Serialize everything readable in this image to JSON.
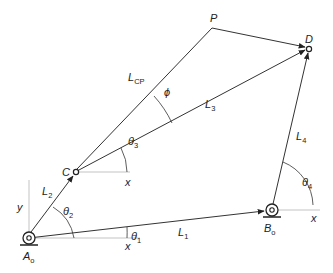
{
  "diagram": {
    "type": "four-bar linkage coupler point diagram",
    "points": {
      "A0": {
        "label": "A",
        "sub": "o",
        "x": 29,
        "y": 238
      },
      "B0": {
        "label": "B",
        "sub": "o",
        "x": 272,
        "y": 210
      },
      "C": {
        "label": "C",
        "x": 75,
        "y": 172
      },
      "D": {
        "label": "D",
        "x": 309,
        "y": 48
      },
      "P": {
        "label": "P",
        "x": 212,
        "y": 28
      }
    },
    "links": [
      {
        "name": "L1",
        "label": "L",
        "sub": "1",
        "from": "A0",
        "to": "B0"
      },
      {
        "name": "L2",
        "label": "L",
        "sub": "2",
        "from": "A0",
        "to": "C"
      },
      {
        "name": "L3",
        "label": "L",
        "sub": "3",
        "from": "C",
        "to": "D"
      },
      {
        "name": "L4",
        "label": "L",
        "sub": "4",
        "from": "B0",
        "to": "D"
      },
      {
        "name": "LCP",
        "label": "L",
        "sub": "CP",
        "from": "C",
        "to": "P"
      },
      {
        "name": "PD",
        "label": "",
        "from": "P",
        "to": "D"
      }
    ],
    "angles": {
      "theta1": {
        "label": "θ",
        "sub": "1"
      },
      "theta2": {
        "label": "θ",
        "sub": "2"
      },
      "theta3": {
        "label": "θ",
        "sub": "3"
      },
      "theta4": {
        "label": "θ",
        "sub": "4"
      },
      "phi": {
        "label": "ϕ"
      }
    },
    "axes": {
      "y_label": "y",
      "x_label_A0": "x",
      "x_label_C": "x",
      "x_label_B0": "x"
    }
  }
}
